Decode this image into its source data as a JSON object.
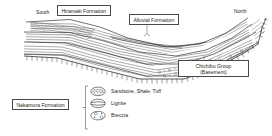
{
  "figure": {
    "type": "geological-cross-section",
    "orientation_labels": {
      "left": "South",
      "right": "North"
    },
    "units": [
      {
        "id": "hiramaki",
        "label": "Hiramaki Formation",
        "boxed": true
      },
      {
        "id": "alluvial",
        "label": "Alluvial Formation",
        "boxed": true
      },
      {
        "id": "chichibu",
        "label": "Chichibu Group\n(Basement)",
        "line1": "Chichibu Group",
        "line2": "(Basement)",
        "boxed": true
      },
      {
        "id": "nakamura",
        "label": "Nakamura Formation",
        "boxed": true
      }
    ],
    "legend": {
      "items": [
        {
          "symbol": "stipple-ellipse",
          "label": "Sandsone, Shale, Tuff"
        },
        {
          "symbol": "split-ellipse",
          "label": "Lignite"
        },
        {
          "symbol": "clast-ellipse",
          "label": "Breccia"
        }
      ]
    },
    "colors": {
      "ink": "#231f20",
      "line": "#4a4a4a",
      "background": "#ffffff"
    }
  }
}
